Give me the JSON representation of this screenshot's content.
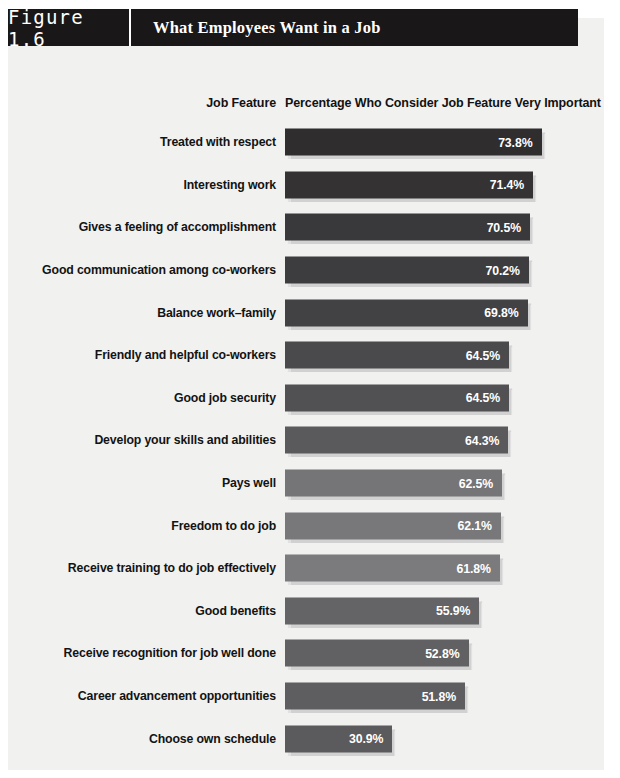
{
  "figure": {
    "number_label": "Figure 1.6",
    "title": "What Employees Want in a Job"
  },
  "columns": {
    "left_header": "Job Feature",
    "right_header": "Percentage Who Consider Job Feature Very Important"
  },
  "colors": {
    "header_bg": "#1a1718",
    "header_text": "#ffffff",
    "page_bg": "#f1f1f0",
    "label_text": "#131313",
    "value_text": "#ffffff"
  },
  "chart_data": {
    "type": "bar",
    "orientation": "horizontal",
    "title": "What Employees Want in a Job",
    "xlabel": "Percentage Who Consider Job Feature Very Important",
    "ylabel": "Job Feature",
    "xlim": [
      0,
      80
    ],
    "grid": false,
    "legend": "none",
    "value_suffix": "%",
    "categories": [
      "Treated with respect",
      "Interesting work",
      "Gives a feeling of accomplishment",
      "Good communication among co-workers",
      "Balance work–family",
      "Friendly and helpful co-workers",
      "Good job security",
      "Develop your skills and abilities",
      "Pays well",
      "Freedom to do job",
      "Receive training to do job effectively",
      "Good benefits",
      "Receive recognition for job well done",
      "Career advancement opportunities",
      "Choose own schedule"
    ],
    "values": [
      73.8,
      71.4,
      70.5,
      70.2,
      69.8,
      64.5,
      64.5,
      64.3,
      62.5,
      62.1,
      61.8,
      55.9,
      52.8,
      51.8,
      30.9
    ],
    "value_labels": [
      "73.8%",
      "71.4%",
      "70.5%",
      "70.2%",
      "69.8%",
      "64.5%",
      "64.5%",
      "64.3%",
      "62.5%",
      "62.1%",
      "61.8%",
      "55.9%",
      "52.8%",
      "51.8%",
      "30.9%"
    ],
    "bar_colors": [
      "#2f2d2e",
      "#343233",
      "#39383a",
      "#3d3c3e",
      "#424143",
      "#4a494b",
      "#515052",
      "#5a595b",
      "#757476",
      "#78777a",
      "#7b7a7d",
      "#646365",
      "#616062",
      "#5e5d5f",
      "#5b5a5c"
    ]
  }
}
